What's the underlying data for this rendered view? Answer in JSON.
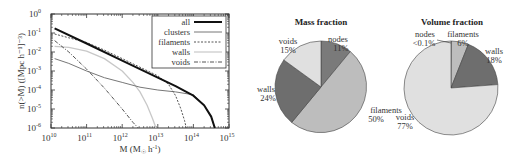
{
  "chart_data": [
    {
      "type": "line",
      "title": "",
      "xlabel": "M (M☉ h⁻¹)",
      "ylabel": "n(>M) ([Mpc h⁻¹]⁻³)",
      "xscale": "log",
      "yscale": "log",
      "xlim": [
        10000000000.0,
        1000000000000000.0
      ],
      "ylim": [
        1e-06,
        1
      ],
      "x_tick_labels": [
        "10^10",
        "10^11",
        "10^12",
        "10^13",
        "10^14",
        "10^15"
      ],
      "y_tick_labels": [
        "10^0",
        "10^-1",
        "10^-2",
        "10^-3",
        "10^-4",
        "10^-5",
        "10^-6"
      ],
      "legend_position": "upper right",
      "grid": false,
      "series": [
        {
          "name": "all",
          "style": "thick solid black",
          "color": "#111111",
          "log_x": [
            10.1,
            11,
            12,
            13,
            13.5,
            14,
            14.3,
            14.5,
            14.6
          ],
          "log_y": [
            -0.75,
            -1.55,
            -2.45,
            -3.35,
            -3.8,
            -4.3,
            -4.8,
            -5.4,
            -6.0
          ]
        },
        {
          "name": "clusters",
          "style": "solid grey",
          "color": "#777777",
          "log_x": [
            10.1,
            10.5,
            11,
            11.5,
            12,
            12.5,
            13,
            13.5,
            14,
            14.3,
            14.5,
            14.6
          ],
          "log_y": [
            -2.35,
            -2.6,
            -3.0,
            -3.35,
            -3.6,
            -3.85,
            -4.0,
            -4.1,
            -4.25,
            -4.8,
            -5.4,
            -6.0
          ]
        },
        {
          "name": "filaments",
          "style": "dashed",
          "color": "#555555",
          "log_x": [
            10.1,
            10.5,
            11,
            11.5,
            12,
            12.5,
            13,
            13.3,
            13.5,
            13.65,
            13.75,
            13.8
          ],
          "log_y": [
            -1.05,
            -1.25,
            -1.5,
            -1.9,
            -2.35,
            -2.8,
            -3.25,
            -3.7,
            -4.3,
            -5.0,
            -5.6,
            -6.0
          ]
        },
        {
          "name": "walls",
          "style": "solid light grey",
          "color": "#c8c8c8",
          "log_x": [
            10.1,
            10.5,
            11,
            11.5,
            12,
            12.3,
            12.5,
            12.7,
            12.85,
            12.95
          ],
          "log_y": [
            -1.7,
            -1.75,
            -1.95,
            -2.35,
            -3.0,
            -3.6,
            -4.1,
            -4.8,
            -5.5,
            -6.0
          ]
        },
        {
          "name": "voids",
          "style": "dash-dot",
          "color": "#555555",
          "log_x": [
            10.1,
            10.5,
            11,
            11.5,
            12,
            12.3,
            12.45
          ],
          "log_y": [
            -1.4,
            -2.0,
            -2.9,
            -3.9,
            -5.0,
            -5.7,
            -6.0
          ]
        }
      ]
    },
    {
      "type": "pie",
      "title": "Mass fraction",
      "slices": [
        {
          "label": "nodes",
          "value": 11,
          "text": "11%",
          "color": "#7a7a7a"
        },
        {
          "label": "filaments",
          "value": 50,
          "text": "50%",
          "color": "#bdbdbd"
        },
        {
          "label": "walls",
          "value": 24,
          "text": "24%",
          "color": "#6e6e6e"
        },
        {
          "label": "voids",
          "value": 15,
          "text": "15%",
          "color": "#e0e0e0"
        }
      ]
    },
    {
      "type": "pie",
      "title": "Volume fraction",
      "slices": [
        {
          "label": "nodes",
          "value": 0.1,
          "text": "<0.1%",
          "color": "#7a7a7a"
        },
        {
          "label": "filaments",
          "value": 6,
          "text": "6%",
          "color": "#bdbdbd"
        },
        {
          "label": "walls",
          "value": 18,
          "text": "18%",
          "color": "#6e6e6e"
        },
        {
          "label": "voids",
          "value": 77,
          "text": "77%",
          "color": "#e0e0e0"
        }
      ]
    }
  ],
  "labels": {
    "xlabel_main": "M (M",
    "xlabel_sub": "☉",
    "xlabel_tail": " h",
    "xlabel_sup": "-1",
    "xlabel_close": ")",
    "ylabel": "n(>M) ([Mpc h⁻¹]⁻³)",
    "mass_title": "Mass fraction",
    "volume_title": "Volume fraction",
    "legend": [
      "all",
      "clusters",
      "filaments",
      "walls",
      "voids"
    ],
    "xticks": [
      "10",
      "10",
      "10",
      "10",
      "10",
      "10"
    ],
    "xtick_exp": [
      "10",
      "11",
      "12",
      "13",
      "14",
      "15"
    ],
    "yticks": [
      "10",
      "10",
      "10",
      "10",
      "10",
      "10",
      "10"
    ],
    "ytick_exp": [
      "0",
      "-1",
      "-2",
      "-3",
      "-4",
      "-5",
      "-6"
    ],
    "mass_slices": [
      {
        "name": "nodes",
        "pct": "11%"
      },
      {
        "name": "filaments",
        "pct": "50%"
      },
      {
        "name": "walls",
        "pct": "24%"
      },
      {
        "name": "voids",
        "pct": "15%"
      }
    ],
    "volume_slices": [
      {
        "name": "nodes",
        "pct": "<0.1%"
      },
      {
        "name": "filaments",
        "pct": "6%"
      },
      {
        "name": "walls",
        "pct": "18%"
      },
      {
        "name": "voids",
        "pct": "77%"
      }
    ]
  }
}
